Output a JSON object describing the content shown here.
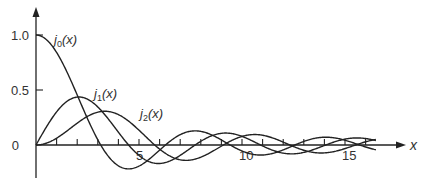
{
  "chart_data": {
    "type": "line",
    "title": "",
    "xlabel": "x",
    "ylabel": "",
    "xlim": [
      0,
      16.5
    ],
    "ylim": [
      -0.3,
      1.25
    ],
    "grid": false,
    "legend": "inline labels",
    "x_ticks": [
      1,
      2,
      3,
      4,
      5,
      6,
      7,
      8,
      9,
      10,
      11,
      12,
      13,
      14,
      15,
      16
    ],
    "x_tick_labels": [
      {
        "value": 5,
        "label": "5"
      },
      {
        "value": 10,
        "label": "10"
      },
      {
        "value": 15,
        "label": "15"
      }
    ],
    "y_ticks": [
      {
        "value": 0,
        "label": "0"
      },
      {
        "value": 0.5,
        "label": "0.5"
      },
      {
        "value": 1.0,
        "label": "1.0"
      }
    ],
    "x": [
      0,
      1,
      2,
      3,
      4,
      5,
      6,
      7,
      8,
      9,
      10,
      11,
      12,
      13,
      14,
      15,
      16
    ],
    "series": [
      {
        "name": "j0(x)",
        "label_main": "j",
        "label_sub": "0",
        "label_tail": "(x)",
        "function": "j0",
        "values": [
          1.0,
          0.841,
          0.455,
          0.047,
          -0.189,
          -0.192,
          -0.047,
          0.094,
          0.124,
          0.046,
          -0.054,
          -0.091,
          -0.045,
          0.032,
          0.071,
          0.043,
          -0.018
        ]
      },
      {
        "name": "j1(x)",
        "label_main": "j",
        "label_sub": "1",
        "label_tail": "(x)",
        "function": "j1",
        "values": [
          0.0,
          0.301,
          0.435,
          0.346,
          0.116,
          -0.095,
          -0.167,
          -0.077,
          0.057,
          0.111,
          0.078,
          -0.009,
          -0.07,
          -0.069,
          -0.012,
          0.048,
          0.059
        ]
      },
      {
        "name": "j2(x)",
        "label_main": "j",
        "label_sub": "2",
        "label_tail": "(x)",
        "function": "j2",
        "values": [
          0.0,
          0.062,
          0.198,
          0.299,
          0.276,
          0.135,
          -0.037,
          -0.14,
          -0.114,
          0.001,
          0.077,
          0.09,
          0.024,
          -0.04,
          -0.068,
          -0.044,
          0.008
        ]
      }
    ],
    "annotations": [
      {
        "text": "j0(x)",
        "near_x": 0.9,
        "near_y": 0.93
      },
      {
        "text": "j1(x)",
        "near_x": 2.8,
        "near_y": 0.45
      },
      {
        "text": "j2(x)",
        "near_x": 5.0,
        "near_y": 0.28
      }
    ],
    "colors": {
      "line": "#222222",
      "text": "#333333",
      "background": "#ffffff"
    }
  }
}
